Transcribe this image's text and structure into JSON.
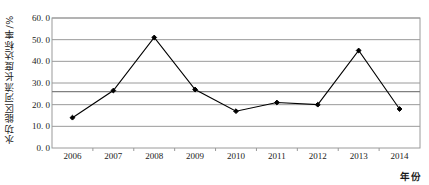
{
  "chart_data": {
    "type": "line",
    "title": "",
    "xlabel": "年份",
    "ylabel": "水功能区河流长度达标率/%",
    "categories": [
      "2006",
      "2007",
      "2008",
      "2009",
      "2010",
      "2011",
      "2012",
      "2013",
      "2014"
    ],
    "values": [
      14.0,
      26.5,
      51.0,
      27.0,
      17.0,
      21.0,
      20.0,
      45.0,
      18.0
    ],
    "series": [
      {
        "name": "水功能区河流长度达标率",
        "values": [
          14.0,
          26.5,
          51.0,
          27.0,
          17.0,
          21.0,
          20.0,
          45.0,
          18.0
        ],
        "marker": "filled-diamond",
        "color": "#000000"
      }
    ],
    "reference_line": {
      "value": 26.0,
      "label": "",
      "color": "#808080"
    },
    "ylim": [
      0.0,
      60.0
    ],
    "ytick_values": [
      0.0,
      10.0,
      20.0,
      30.0,
      40.0,
      50.0,
      60.0
    ],
    "ytick_labels": [
      "0. 0",
      "10. 0",
      "20. 0",
      "30. 0",
      "40. 0",
      "50. 0",
      "60. 0"
    ],
    "grid": true,
    "grid_axis": "y",
    "grid_color": "#9a9a9a",
    "legend": false,
    "legend_position": "none",
    "plot_bg": "#ffffff",
    "border_color": "#9a9a9a"
  }
}
